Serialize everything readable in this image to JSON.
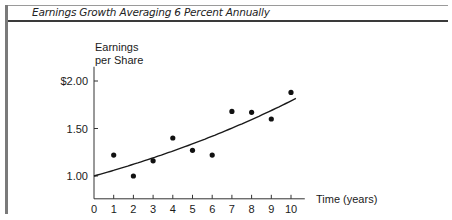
{
  "title": "Earnings Growth Averaging 6 Percent Annually",
  "chart_data": {
    "type": "scatter",
    "title": "Earnings Growth Averaging 6 Percent Annually",
    "xlabel": "Time (years)",
    "ylabel": "Earnings per Share",
    "ylabel_lines": [
      "Earnings",
      "per Share"
    ],
    "x": [
      1,
      2,
      3,
      4,
      5,
      6,
      7,
      8,
      9,
      10
    ],
    "series": [
      {
        "name": "Earnings per Share",
        "type": "scatter",
        "values": [
          1.22,
          1.0,
          1.16,
          1.4,
          1.27,
          1.22,
          1.68,
          1.67,
          1.6,
          1.88
        ]
      },
      {
        "name": "6% growth trend",
        "type": "line",
        "formula": "1.00 * 1.06^t",
        "x": [
          0,
          1,
          2,
          3,
          4,
          5,
          6,
          7,
          8,
          9,
          10
        ],
        "values": [
          1.0,
          1.06,
          1.12,
          1.19,
          1.26,
          1.34,
          1.42,
          1.5,
          1.59,
          1.69,
          1.79
        ]
      }
    ],
    "x_ticks": [
      "0",
      "1",
      "2",
      "3",
      "4",
      "5",
      "6",
      "7",
      "8",
      "9",
      "10"
    ],
    "y_ticks": [
      {
        "value": 1.0,
        "label": "1.00"
      },
      {
        "value": 1.5,
        "label": "1.50"
      },
      {
        "value": 2.0,
        "label": "$2.00"
      }
    ],
    "xlim": [
      0,
      10.7
    ],
    "ylim": [
      0.76,
      2.15
    ],
    "grid": false,
    "legend": "none"
  }
}
